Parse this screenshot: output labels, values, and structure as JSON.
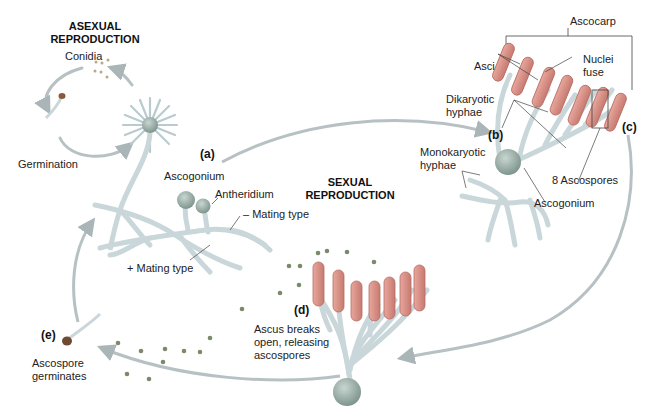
{
  "headings": {
    "asexual_line1": "ASEXUAL",
    "asexual_line2": "REPRODUCTION",
    "sexual_line1": "SEXUAL",
    "sexual_line2": "REPRODUCTION"
  },
  "stages": {
    "a": "(a)",
    "b": "(b)",
    "c": "(c)",
    "d": "(d)",
    "e": "(e)"
  },
  "labels": {
    "conidia": "Conidia",
    "germination": "Germination",
    "ascogonium_a": "Ascogonium",
    "antheridium": "Antheridium",
    "minus_mating": "– Mating type",
    "plus_mating": "+ Mating type",
    "ascocarp": "Ascocarp",
    "asci": "Asci",
    "nuclei_fuse_1": "Nuclei",
    "nuclei_fuse_2": "fuse",
    "dikaryotic_1": "Dikaryotic",
    "dikaryotic_2": "hyphae",
    "monokaryotic_1": "Monokaryotic",
    "monokaryotic_2": "hyphae",
    "eight_ascospores": "8 Ascospores",
    "ascogonium_b": "Ascogonium",
    "ascus_breaks_1": "Ascus breaks",
    "ascus_breaks_2": "open, releasing",
    "ascus_breaks_3": "ascospores",
    "ascospore_germ_1": "Ascospore",
    "ascospore_germ_2": "germinates"
  },
  "colors": {
    "hyphae": "#c9d7da",
    "hyphae_edge": "#9fb2b6",
    "ascus": "#d98f86",
    "ascus_edge": "#b56a62",
    "spore": "#7a8a6a",
    "arrow": "#b7c1c4",
    "ascogonium": "#8fa5a0"
  }
}
